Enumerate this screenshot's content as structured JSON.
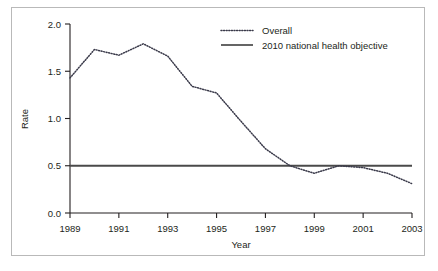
{
  "chart_data": {
    "type": "line",
    "title": "",
    "xlabel": "Year",
    "ylabel": "Rate",
    "xlim": [
      1989,
      2003
    ],
    "ylim": [
      0.0,
      2.0
    ],
    "grid": false,
    "legend_position": "top-right",
    "x": [
      1989,
      1990,
      1991,
      1992,
      1993,
      1994,
      1995,
      1996,
      1997,
      1998,
      1999,
      2000,
      2001,
      2002,
      2003
    ],
    "series": [
      {
        "name": "Overall",
        "style": "dotted",
        "color": "#3a3a4a",
        "values": [
          1.43,
          1.73,
          1.67,
          1.79,
          1.66,
          1.34,
          1.27,
          0.97,
          0.68,
          0.5,
          0.42,
          0.5,
          0.48,
          0.42,
          0.31
        ]
      },
      {
        "name": "2010 national health objective",
        "style": "solid",
        "color": "#4a4a4a",
        "constant": 0.5,
        "values": [
          0.5,
          0.5,
          0.5,
          0.5,
          0.5,
          0.5,
          0.5,
          0.5,
          0.5,
          0.5,
          0.5,
          0.5,
          0.5,
          0.5,
          0.5
        ]
      }
    ],
    "ytick_labels": [
      "0.0",
      "0.5",
      "1.0",
      "1.5",
      "2.0"
    ],
    "ytick_values": [
      0.0,
      0.5,
      1.0,
      1.5,
      2.0
    ],
    "xtick_labels": [
      "1989",
      "1991",
      "1993",
      "1995",
      "1997",
      "1999",
      "2001",
      "2003"
    ],
    "xtick_values": [
      1989,
      1991,
      1993,
      1995,
      1997,
      1999,
      2001,
      2003
    ]
  },
  "legend": {
    "items": [
      {
        "label": "Overall"
      },
      {
        "label": "2010 national health objective"
      }
    ]
  },
  "axes": {
    "y_title": "Rate",
    "x_title": "Year"
  },
  "colors": {
    "axis": "#231f20",
    "series_overall": "#3a3a4a",
    "series_objective": "#4a4a4a",
    "frame_border": "#b9b9b9",
    "background": "#ffffff"
  }
}
